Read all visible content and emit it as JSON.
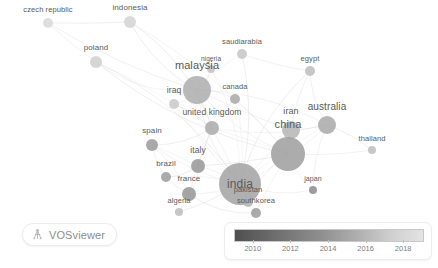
{
  "app": {
    "name": "VOSviewer",
    "view_type": "overlay-visualization",
    "canvas_background": "#ffffff"
  },
  "branding": {
    "badge_label": "VOSviewer",
    "icon": "vosviewer-logo-icon"
  },
  "legend": {
    "title": "",
    "type": "score-gradient",
    "ticks": [
      "2010",
      "2012",
      "2014",
      "2016",
      "2018"
    ],
    "gradient_from": "#4f4f4f",
    "gradient_to": "#e4e4e4",
    "min_year": 2009,
    "max_year": 2019
  },
  "chart_data": {
    "type": "scatter",
    "title": "",
    "xlabel": "",
    "ylabel": "",
    "colormap": "grayscale",
    "color_variable": "average publication year",
    "color_range": [
      2010,
      2018
    ],
    "grid": false,
    "legend_position": "bottom-right",
    "nodes": [
      {
        "label": "czech republic",
        "x": 48,
        "y": 23,
        "size": 5,
        "year": 2018,
        "shade": "#d9d9d9",
        "font": 7.5,
        "label_dx": 0,
        "label_dy": -9
      },
      {
        "label": "indonesia",
        "x": 130,
        "y": 22,
        "size": 6,
        "year": 2018,
        "shade": "#d4d4d4",
        "font": 8,
        "label_dx": 0,
        "label_dy": -9
      },
      {
        "label": "poland",
        "x": 96,
        "y": 62,
        "size": 6,
        "year": 2017,
        "shade": "#cfcfcf",
        "font": 8,
        "label_dx": 0,
        "label_dy": -9
      },
      {
        "label": "saudiarabia",
        "x": 242,
        "y": 54,
        "size": 5,
        "year": 2016,
        "shade": "#c6c6c6",
        "font": 7.5,
        "label_dx": 0,
        "label_dy": -8
      },
      {
        "label": "nigeria",
        "x": 211,
        "y": 69,
        "size": 4,
        "year": 2016,
        "shade": "#c2c2c2",
        "font": 6.5,
        "label_dx": 0,
        "label_dy": -7
      },
      {
        "label": "egypt",
        "x": 310,
        "y": 71,
        "size": 5,
        "year": 2015,
        "shade": "#bdbdbd",
        "font": 7.5,
        "label_dx": 0,
        "label_dy": -8
      },
      {
        "label": "malaysia",
        "x": 197,
        "y": 90,
        "size": 14,
        "year": 2014,
        "shade": "#adadad",
        "font": 11,
        "label_dx": 0,
        "label_dy": -11
      },
      {
        "label": "iraq",
        "x": 174,
        "y": 104,
        "size": 5,
        "year": 2017,
        "shade": "#c9c9c9",
        "font": 8.5,
        "label_dx": 0,
        "label_dy": -9
      },
      {
        "label": "canada",
        "x": 235,
        "y": 99,
        "size": 5,
        "year": 2013,
        "shade": "#a8a8a8",
        "font": 7.5,
        "label_dx": 0,
        "label_dy": -8
      },
      {
        "label": "united kingdom",
        "x": 212,
        "y": 128,
        "size": 7,
        "year": 2013,
        "shade": "#aaaaaa",
        "font": 8.5,
        "label_dx": 0,
        "label_dy": -9
      },
      {
        "label": "iran",
        "x": 291,
        "y": 130,
        "size": 9,
        "year": 2015,
        "shade": "#b5b5b5",
        "font": 9,
        "label_dx": 0,
        "label_dy": -10
      },
      {
        "label": "australia",
        "x": 327,
        "y": 125,
        "size": 9,
        "year": 2013,
        "shade": "#a9a9a9",
        "font": 10,
        "label_dx": 0,
        "label_dy": -10
      },
      {
        "label": "thailand",
        "x": 372,
        "y": 150,
        "size": 4,
        "year": 2014,
        "shade": "#bebebe",
        "font": 7.5,
        "label_dx": 0,
        "label_dy": -8
      },
      {
        "label": "china",
        "x": 288,
        "y": 154,
        "size": 17,
        "year": 2014,
        "shade": "#9e9e9e",
        "font": 11,
        "label_dx": 0,
        "label_dy": -13
      },
      {
        "label": "spain",
        "x": 152,
        "y": 145,
        "size": 6,
        "year": 2012,
        "shade": "#9a9a9a",
        "font": 8,
        "label_dx": 0,
        "label_dy": -9
      },
      {
        "label": "italy",
        "x": 198,
        "y": 166,
        "size": 7,
        "year": 2012,
        "shade": "#979797",
        "font": 8.5,
        "label_dx": 0,
        "label_dy": -9
      },
      {
        "label": "brazil",
        "x": 166,
        "y": 177,
        "size": 5,
        "year": 2012,
        "shade": "#9c9c9c",
        "font": 8,
        "label_dx": 0,
        "label_dy": -9
      },
      {
        "label": "india",
        "x": 240,
        "y": 184,
        "size": 21,
        "year": 2013,
        "shade": "#a2a2a2",
        "font": 12,
        "label_dx": 0,
        "label_dy": 0
      },
      {
        "label": "japan",
        "x": 313,
        "y": 190,
        "size": 4,
        "year": 2011,
        "shade": "#8c8c8c",
        "font": 7,
        "label_dx": 0,
        "label_dy": -8
      },
      {
        "label": "france",
        "x": 189,
        "y": 194,
        "size": 7,
        "year": 2012,
        "shade": "#959595",
        "font": 8,
        "label_dx": 0,
        "label_dy": -9
      },
      {
        "label": "pakistan",
        "x": 248,
        "y": 202,
        "size": 5,
        "year": 2014,
        "shade": "#b2b2b2",
        "font": 7.5,
        "label_dx": 0,
        "label_dy": -8
      },
      {
        "label": "algeria",
        "x": 179,
        "y": 212,
        "size": 4,
        "year": 2015,
        "shade": "#bcbcbc",
        "font": 7.5,
        "label_dx": 0,
        "label_dy": -8
      },
      {
        "label": "southkorea",
        "x": 256,
        "y": 213,
        "size": 5,
        "year": 2012,
        "shade": "#9b9b9b",
        "font": 7.5,
        "label_dx": 0,
        "label_dy": -8
      }
    ],
    "edges": [
      [
        "czech republic",
        "poland"
      ],
      [
        "czech republic",
        "indonesia"
      ],
      [
        "czech republic",
        "malaysia"
      ],
      [
        "indonesia",
        "malaysia"
      ],
      [
        "indonesia",
        "united kingdom"
      ],
      [
        "indonesia",
        "china"
      ],
      [
        "poland",
        "malaysia"
      ],
      [
        "poland",
        "united kingdom"
      ],
      [
        "poland",
        "india"
      ],
      [
        "poland",
        "china"
      ],
      [
        "saudiarabia",
        "malaysia"
      ],
      [
        "saudiarabia",
        "egypt"
      ],
      [
        "saudiarabia",
        "india"
      ],
      [
        "nigeria",
        "malaysia"
      ],
      [
        "nigeria",
        "india"
      ],
      [
        "egypt",
        "iran"
      ],
      [
        "egypt",
        "india"
      ],
      [
        "egypt",
        "australia"
      ],
      [
        "malaysia",
        "iraq"
      ],
      [
        "malaysia",
        "canada"
      ],
      [
        "malaysia",
        "united kingdom"
      ],
      [
        "malaysia",
        "china"
      ],
      [
        "malaysia",
        "india"
      ],
      [
        "malaysia",
        "australia"
      ],
      [
        "malaysia",
        "iran"
      ],
      [
        "iraq",
        "united kingdom"
      ],
      [
        "iraq",
        "india"
      ],
      [
        "canada",
        "united kingdom"
      ],
      [
        "canada",
        "china"
      ],
      [
        "canada",
        "india"
      ],
      [
        "united kingdom",
        "italy"
      ],
      [
        "united kingdom",
        "india"
      ],
      [
        "united kingdom",
        "china"
      ],
      [
        "united kingdom",
        "australia"
      ],
      [
        "united kingdom",
        "spain"
      ],
      [
        "united kingdom",
        "france"
      ],
      [
        "iran",
        "china"
      ],
      [
        "iran",
        "india"
      ],
      [
        "iran",
        "australia"
      ],
      [
        "australia",
        "china"
      ],
      [
        "australia",
        "india"
      ],
      [
        "australia",
        "thailand"
      ],
      [
        "australia",
        "japan"
      ],
      [
        "thailand",
        "china"
      ],
      [
        "china",
        "india"
      ],
      [
        "china",
        "japan"
      ],
      [
        "china",
        "southkorea"
      ],
      [
        "china",
        "pakistan"
      ],
      [
        "spain",
        "italy"
      ],
      [
        "spain",
        "brazil"
      ],
      [
        "spain",
        "france"
      ],
      [
        "spain",
        "india"
      ],
      [
        "italy",
        "france"
      ],
      [
        "italy",
        "brazil"
      ],
      [
        "italy",
        "india"
      ],
      [
        "italy",
        "china"
      ],
      [
        "brazil",
        "france"
      ],
      [
        "brazil",
        "india"
      ],
      [
        "france",
        "algeria"
      ],
      [
        "france",
        "india"
      ],
      [
        "france",
        "southkorea"
      ],
      [
        "india",
        "pakistan"
      ],
      [
        "india",
        "southkorea"
      ],
      [
        "india",
        "japan"
      ],
      [
        "india",
        "algeria"
      ],
      [
        "pakistan",
        "southkorea"
      ]
    ]
  }
}
